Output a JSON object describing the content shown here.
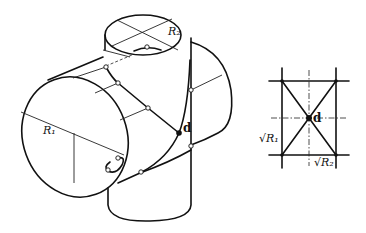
{
  "figure": {
    "left_view": {
      "labels": {
        "radius_horizontal": "R₁",
        "radius_vertical": "R₂",
        "intersection_point": "d"
      }
    },
    "right_view": {
      "labels": {
        "sqrt_r1": "√R₁",
        "sqrt_r2": "√R₂",
        "intersection_point": "d"
      }
    }
  }
}
